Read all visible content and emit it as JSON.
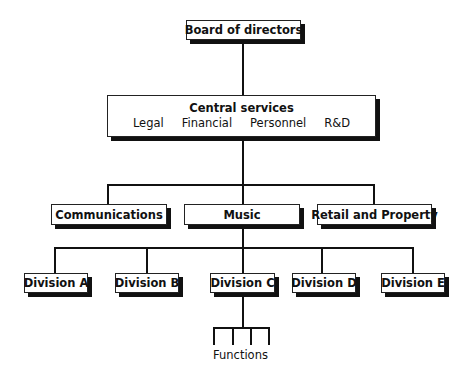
{
  "board": {
    "label": "Board of directors"
  },
  "central_services": {
    "title": "Central services",
    "items": [
      "Legal",
      "Financial",
      "Personnel",
      "R&D"
    ]
  },
  "level2": [
    {
      "label": "Communications"
    },
    {
      "label": "Music"
    },
    {
      "label": "Retail and Property"
    }
  ],
  "divisions": [
    {
      "label": "Division A"
    },
    {
      "label": "Division B"
    },
    {
      "label": "Division C"
    },
    {
      "label": "Division D"
    },
    {
      "label": "Division E"
    }
  ],
  "functions": {
    "label": "Functions"
  }
}
